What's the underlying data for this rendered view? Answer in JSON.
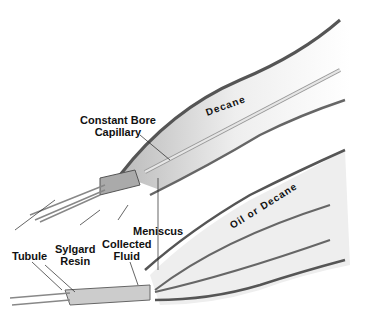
{
  "diagram": {
    "labels": {
      "decane": "Decane",
      "capillary_line1": "Constant Bore",
      "capillary_line2": "Capillary",
      "oil_or_decane": "Oil or Decane",
      "meniscus": "Meniscus",
      "collected_line1": "Collected",
      "collected_line2": "Fluid",
      "sylgard_line1": "Sylgard",
      "sylgard_line2": "Resin",
      "tubule": "Tubule"
    }
  }
}
